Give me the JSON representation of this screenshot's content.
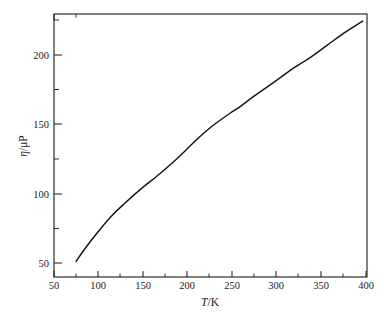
{
  "figure": {
    "background_color": "#ffffff",
    "line_color": "#141414",
    "axis_color": "#1a1a1a"
  },
  "chart_data": {
    "type": "line",
    "title": "",
    "subtitle": "",
    "xlabel": "T/K",
    "xlabel_symbol": "T",
    "xlabel_unit": "/K",
    "ylabel": "η/μP",
    "ylabel_symbol": "η",
    "ylabel_unit": "/μP",
    "xlim": [
      50,
      405
    ],
    "ylim": [
      41,
      227
    ],
    "grid": false,
    "legend": "none",
    "x_ticks": [
      50,
      100,
      150,
      200,
      250,
      300,
      350,
      400
    ],
    "x_tick_labels": [
      "50",
      "100",
      "150",
      "200",
      "250",
      "300",
      "350",
      "400"
    ],
    "x_minor_ticks": [
      75,
      125,
      175,
      225,
      275,
      325,
      375
    ],
    "y_ticks": [
      50,
      100,
      150,
      200
    ],
    "y_tick_labels": [
      "50",
      "100",
      "150",
      "200"
    ],
    "y_minor_ticks": [
      75,
      125,
      175,
      225
    ],
    "series": [
      {
        "name": "viscosity",
        "x": [
          75,
          85,
          100,
          115,
          130,
          150,
          170,
          190,
          200,
          215,
          230,
          250,
          260,
          275,
          300,
          320,
          340,
          360,
          380,
          400
        ],
        "values": [
          52,
          61,
          73,
          84,
          93,
          104,
          114,
          125,
          131,
          140,
          148,
          157,
          161,
          168,
          179,
          188,
          196,
          205,
          214,
          222
        ]
      }
    ]
  },
  "axis_labels": {
    "x_title": "T/K",
    "y_title": "η/μP"
  }
}
